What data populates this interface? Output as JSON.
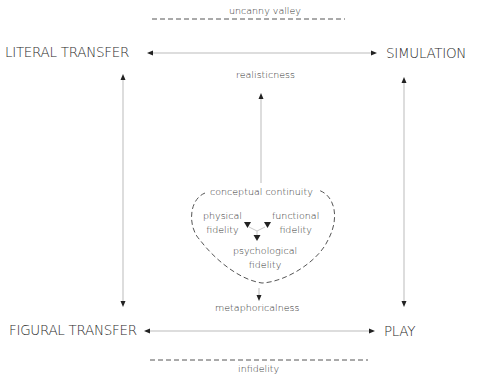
{
  "diagram": {
    "corners": {
      "top_left": "LITERAL TRANSFER",
      "top_right": "SIMULATION",
      "bottom_left": "FIGURAL TRANSFER",
      "bottom_right": "PLAY"
    },
    "boundaries": {
      "top": "uncanny valley",
      "bottom": "infidelity"
    },
    "axes": {
      "up": "realisticness",
      "down": "metaphoricalness"
    },
    "center": {
      "title": "conceptual continuity",
      "nodes": [
        {
          "line1": "physical",
          "line2": "fidelity"
        },
        {
          "line1": "functional",
          "line2": "fidelity"
        },
        {
          "line1": "psychological",
          "line2": "fidelity"
        }
      ]
    },
    "colors": {
      "line": "#999999",
      "arrowhead": "#222222",
      "dash": "#555555"
    }
  }
}
